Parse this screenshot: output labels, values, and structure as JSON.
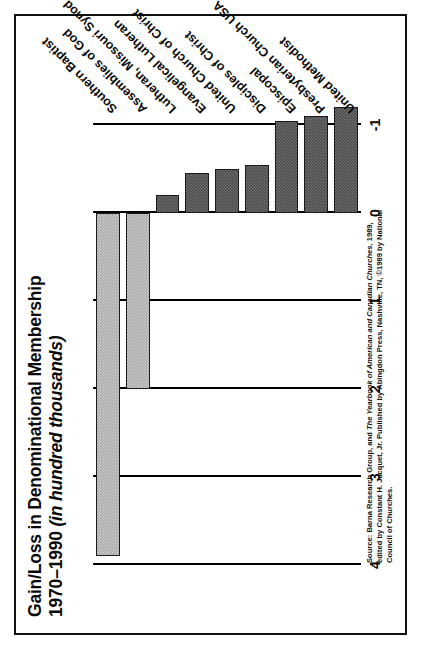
{
  "figure": {
    "title_line1": "Gain/Loss in Denominational Membership",
    "title_line2_plain": "1970–1990 ",
    "title_line2_italic": "(in hundred thousands)",
    "source_note": "Source: Barna Research Group, and The Yearbook of American and Canadian Churches, 1989, edited by Constant H. Jacquet, Jr. Published by Abingdon Press, Nashville, TN, ©1989 by National Council of Churches.",
    "source_seg1": "Source: Barna Research Group, and ",
    "source_seg2_italic": "The Yearbook of American and Canadian Churches,",
    "source_seg3": " 1989, edited by Constant H. Jacquet, Jr. Published by Abingdon Press, Nashville, TN, ©1989 by National Council of Churches."
  },
  "colors": {
    "positive_bar": "#a8a8a8",
    "negative_bar": "#4a4a4a",
    "outline": "#1a1a1a",
    "gridline": "#000000",
    "frame": "#111111",
    "background": "#ffffff",
    "text": "#0a0a0a"
  },
  "chart_data": {
    "type": "bar",
    "orientation": "horizontal",
    "title": "Gain/Loss in Denominational Membership 1970–1990 (in hundred thousands)",
    "xlabel": "",
    "ylabel": "",
    "value_unit": "hundred thousands",
    "grid": true,
    "legend": false,
    "axis_ticks": [
      "4",
      "3",
      "2",
      "1",
      "0",
      "-1"
    ],
    "axis_tick_values": [
      4,
      3,
      2,
      1,
      0,
      -1
    ],
    "axis_range": [
      -1,
      4
    ],
    "categories": [
      "Southern Baptist",
      "Assemblies of God",
      "Lutheran, Missouri Synod",
      "Evangelical Lutheran",
      "United Church of Christ",
      "Disciples of Christ",
      "Episcopal",
      "Presbyterian Church USA",
      "United Methodist"
    ],
    "values": [
      3.9,
      2.0,
      -0.2,
      -0.45,
      -0.5,
      -0.55,
      -1.05,
      -1.1,
      -1.2
    ],
    "bars": [
      {
        "label": "Southern Baptist",
        "value": 3.9,
        "sign": "positive"
      },
      {
        "label": "Assemblies of God",
        "value": 2.0,
        "sign": "positive"
      },
      {
        "label": "Lutheran, Missouri Synod",
        "value": -0.2,
        "sign": "negative"
      },
      {
        "label": "Evangelical Lutheran",
        "value": -0.45,
        "sign": "negative"
      },
      {
        "label": "United Church of Christ",
        "value": -0.5,
        "sign": "negative"
      },
      {
        "label": "Disciples of Christ",
        "value": -0.55,
        "sign": "negative"
      },
      {
        "label": "Episcopal",
        "value": -1.05,
        "sign": "negative"
      },
      {
        "label": "Presbyterian Church USA",
        "value": -1.1,
        "sign": "negative"
      },
      {
        "label": "United Methodist",
        "value": -1.2,
        "sign": "negative"
      }
    ]
  }
}
